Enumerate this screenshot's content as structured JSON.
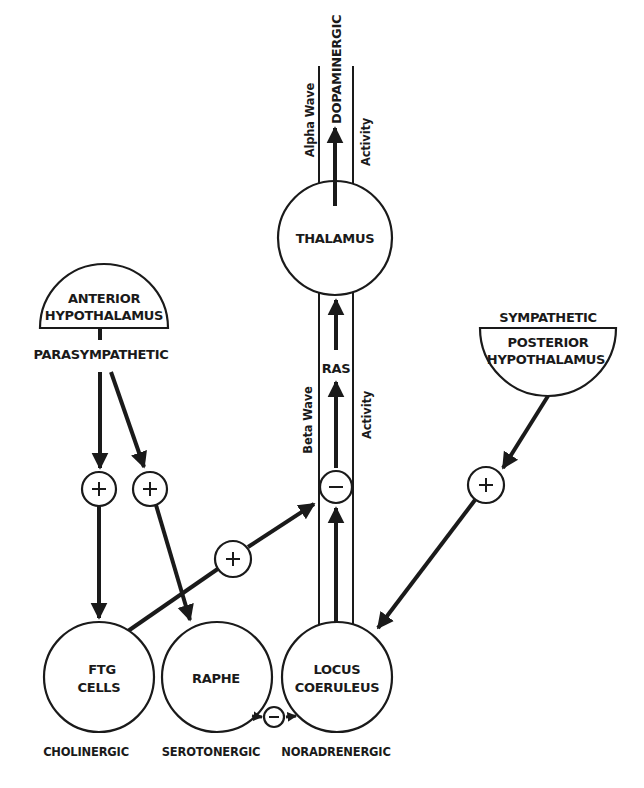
{
  "diagram": {
    "nodes": {
      "thalamus": "THALAMUS",
      "anterior_hypothalamus": [
        "ANTERIOR",
        "HYPOTHALAMUS"
      ],
      "posterior_hypothalamus": [
        "POSTERIOR",
        "HYPOTHALAMUS"
      ],
      "ftg_cells": [
        "FTG",
        "CELLS"
      ],
      "raphe": "RAPHE",
      "locus_coeruleus": [
        "LOCUS",
        "COERULEUS"
      ],
      "ras": "RAS"
    },
    "system_labels": {
      "parasympathetic": "PARASYMPATHETIC",
      "sympathetic": "SYMPATHETIC",
      "dopaminergic": "DOPAMINERGIC"
    },
    "transmitter_labels": {
      "cholinergic": "CHOLINERGIC",
      "serotonergic": "SEROTONERGIC",
      "noradrenergic": "NORADRENERGIC"
    },
    "side_labels": {
      "alpha_wave": "Alpha Wave",
      "activity_top": "Activity",
      "beta_wave": "Beta Wave",
      "activity_mid": "Activity"
    },
    "signs": {
      "plus": "+",
      "minus": "−"
    },
    "edges": [
      {
        "from": "anterior_hypothalamus",
        "to": "ftg_cells",
        "sign": "+"
      },
      {
        "from": "anterior_hypothalamus",
        "to": "raphe",
        "sign": "+"
      },
      {
        "from": "ftg_cells",
        "to": "ras",
        "sign": "+"
      },
      {
        "from": "posterior_hypothalamus",
        "to": "locus_coeruleus",
        "sign": "+"
      },
      {
        "from": "locus_coeruleus",
        "to": "ras",
        "sign": "−"
      },
      {
        "from": "raphe",
        "to": "locus_coeruleus",
        "sign": "−"
      },
      {
        "from": "ras",
        "to": "thalamus",
        "sign": ""
      },
      {
        "from": "thalamus",
        "to": "dopaminergic",
        "sign": ""
      }
    ],
    "colors": {
      "ink": "#1a1a1a",
      "paper": "#ffffff"
    }
  }
}
